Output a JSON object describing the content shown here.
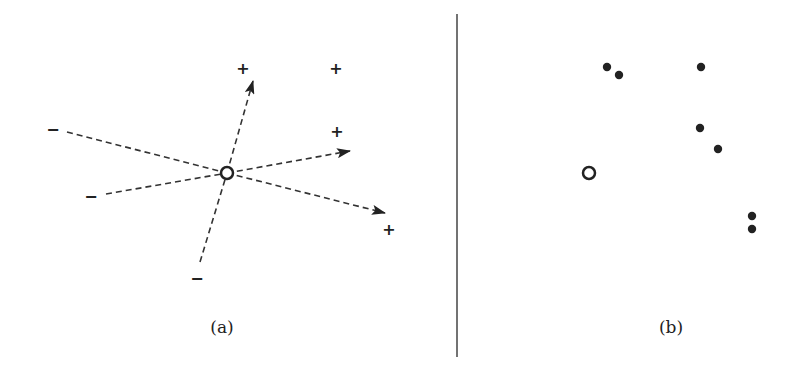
{
  "panels": {
    "a": {
      "caption": "(a)",
      "center": {
        "x": 227,
        "y": 173,
        "r": 6
      },
      "labels": [
        {
          "sign": "+",
          "x": 243,
          "y": 68
        },
        {
          "sign": "+",
          "x": 336,
          "y": 68
        },
        {
          "sign": "+",
          "x": 337,
          "y": 131
        },
        {
          "sign": "+",
          "x": 389,
          "y": 229
        },
        {
          "sign": "−",
          "x": 53,
          "y": 129
        },
        {
          "sign": "−",
          "x": 91,
          "y": 196
        },
        {
          "sign": "−",
          "x": 197,
          "y": 278
        }
      ],
      "arrows": [
        {
          "x2": 253,
          "y2": 81
        },
        {
          "x2": 350,
          "y2": 151
        },
        {
          "x2": 385,
          "y2": 213
        }
      ],
      "dashed_lines": [
        {
          "x1": 67,
          "y1": 132
        },
        {
          "x1": 106,
          "y1": 194
        },
        {
          "x1": 200,
          "y1": 262
        }
      ]
    },
    "b": {
      "caption": "(b)",
      "open_point": {
        "x": 589,
        "y": 173,
        "r": 6
      },
      "points": [
        {
          "x": 607,
          "y": 67
        },
        {
          "x": 619,
          "y": 75
        },
        {
          "x": 701,
          "y": 67
        },
        {
          "x": 700,
          "y": 128
        },
        {
          "x": 718,
          "y": 149
        },
        {
          "x": 752,
          "y": 216
        },
        {
          "x": 752,
          "y": 229
        }
      ]
    }
  },
  "divider": {
    "x": 457,
    "y1": 14,
    "y2": 357
  },
  "colors": {
    "stroke": "#222222",
    "dash": "#333333",
    "divider": "#444444"
  }
}
